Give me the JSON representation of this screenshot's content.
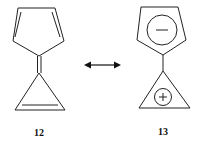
{
  "diagram": {
    "type": "resonance-structures",
    "arrow": "double-headed resonance arrow",
    "structures": [
      {
        "label": "12",
        "description": "cyclopentadienylidene-cyclopropene (triafulvalene-type, neutral form with exocyclic double bond)"
      },
      {
        "label": "13",
        "description": "zwitterionic form: cyclopentadienide anion bonded to cyclopropenium cation"
      }
    ],
    "charges": {
      "anion": "−",
      "cation": "+"
    }
  },
  "colors": {
    "stroke": "#222222",
    "background": "#ffffff"
  }
}
